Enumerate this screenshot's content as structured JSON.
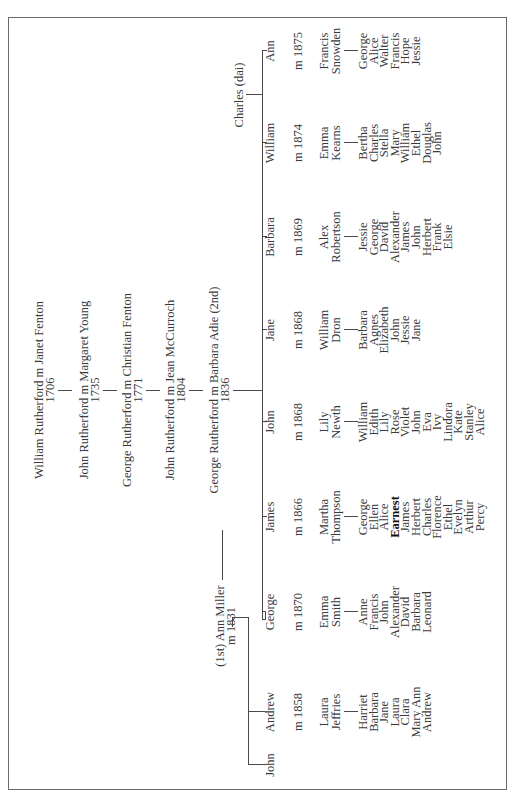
{
  "ancestors": [
    {
      "couple": "William Rutherford m Janet Fenton",
      "year": "1706"
    },
    {
      "couple": "John Rutherford m Margaret Young",
      "year": "1735"
    },
    {
      "couple": "George Rutherford m Christian Fenton",
      "year": "1771"
    },
    {
      "couple": "John Rutherford m Jean McCurroch",
      "year": "1804"
    },
    {
      "couple": "George Rutherford m Barbara Adie (2nd)",
      "year": "1836"
    }
  ],
  "first_wife": {
    "name": "(1st) Ann Miller",
    "marriage": "m 1831"
  },
  "second_marriage_child": {
    "name": "Charles (dai)"
  },
  "children": [
    {
      "name": "John",
      "marriage": "",
      "spouse": [],
      "children": []
    },
    {
      "name": "Andrew",
      "marriage": "m 1858",
      "spouse": [
        "Laura",
        "Jeffries"
      ],
      "children": [
        "Harriet",
        "Barbara",
        "Jane",
        "Laura",
        "Clara",
        "Mary Ann",
        "Andrew"
      ]
    },
    {
      "name": "George",
      "marriage": "m 1870",
      "spouse": [
        "Emma",
        "Smith"
      ],
      "children": [
        "Anne",
        "Francis",
        "John",
        "Alexander",
        "David",
        "Barbara",
        "Leonard"
      ]
    },
    {
      "name": "James",
      "marriage": "m 1866",
      "spouse": [
        "Martha",
        "Thompson"
      ],
      "children": [
        "George",
        "Ellen",
        "Alice",
        "Earnest",
        "James",
        "Herbert",
        "Charles",
        "Florence",
        "Ethel",
        "Evelyn",
        "Arthur",
        "Percy"
      ],
      "highlighted_child": "Earnest"
    },
    {
      "name": "John",
      "marriage": "m 1868",
      "spouse": [
        "Lily",
        "Newth"
      ],
      "children": [
        "William",
        "Edith",
        "Lily",
        "Rose",
        "Violet",
        "John",
        "Eva",
        "Ivy",
        "Lindora",
        "Kate",
        "Stanley",
        "Alice"
      ]
    },
    {
      "name": "Jane",
      "marriage": "m 1868",
      "spouse": [
        "William",
        "Dron"
      ],
      "children": [
        "Barbara",
        "Agnes",
        "Elizabeth",
        "John",
        "Jessie",
        "Jane"
      ]
    },
    {
      "name": "Barbara",
      "marriage": "m 1869",
      "spouse": [
        "Alex",
        "Robertson"
      ],
      "children": [
        "Jessie",
        "George",
        "David",
        "Alexander",
        "James",
        "John",
        "Herbert",
        "Frank",
        "Elsie"
      ]
    },
    {
      "name": "William",
      "marriage": "m 1874",
      "spouse": [
        "Emma",
        "Kearns"
      ],
      "children": [
        "Bertha",
        "Charles",
        "Stella",
        "Mary",
        "William",
        "Ethel",
        "Douglas",
        "John"
      ]
    },
    {
      "name": "Ann",
      "marriage": "m 1875",
      "spouse": [
        "Francis",
        "Snowden"
      ],
      "children": [
        "George",
        "Alice",
        "Walter",
        "Francis",
        "Hope",
        "Jessie"
      ]
    }
  ],
  "colors": {
    "text": "#3a3a3a",
    "lines": "#4a4a4a",
    "border": "#6a6a6a",
    "background": "#ffffff"
  }
}
